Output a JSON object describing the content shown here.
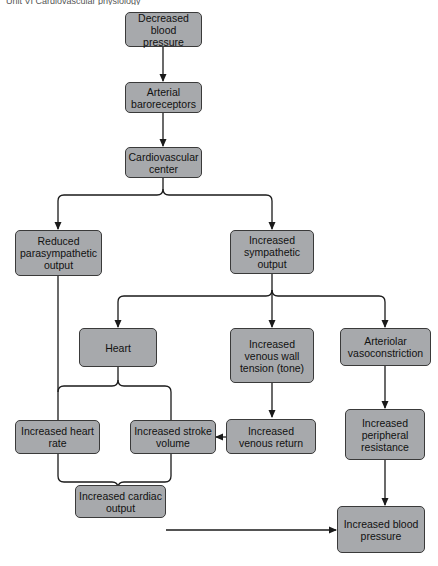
{
  "header": {
    "text": "Unit VI  Cardiovascular physiology"
  },
  "footer": {
    "text": "Figure: baroreceptor reflex response to decreased blood pressure"
  },
  "colors": {
    "node_fill": "#a7a9ac",
    "node_border": "#3a3a3a",
    "arrow": "#1a1a1a"
  },
  "nodes": {
    "decreased_bp": "Decreased blood pressure",
    "baroreceptors": "Arterial baroreceptors",
    "cv_center": "Cardiovascular center",
    "parasympathetic": "Reduced parasympathetic output",
    "sympathetic": "Increased sympathetic output",
    "heart": "Heart",
    "venous_tension": "Increased venous wall tension (tone)",
    "vasoconstriction": "Arteriolar vasoconstriction",
    "heart_rate": "Increased heart rate",
    "stroke_volume": "Increased stroke volume",
    "venous_return": "Increased venous return",
    "peripheral_resistance": "Increased peripheral resistance",
    "cardiac_output": "Increased cardiac output",
    "increased_bp": "Increased blood pressure"
  },
  "edges": [
    [
      "decreased_bp",
      "baroreceptors"
    ],
    [
      "baroreceptors",
      "cv_center"
    ],
    [
      "cv_center",
      "parasympathetic"
    ],
    [
      "cv_center",
      "sympathetic"
    ],
    [
      "sympathetic",
      "heart"
    ],
    [
      "sympathetic",
      "venous_tension"
    ],
    [
      "sympathetic",
      "vasoconstriction"
    ],
    [
      "parasympathetic",
      "heart_rate"
    ],
    [
      "heart",
      "heart_rate"
    ],
    [
      "heart",
      "stroke_volume"
    ],
    [
      "venous_tension",
      "venous_return"
    ],
    [
      "venous_return",
      "stroke_volume"
    ],
    [
      "vasoconstriction",
      "peripheral_resistance"
    ],
    [
      "heart_rate",
      "cardiac_output"
    ],
    [
      "stroke_volume",
      "cardiac_output"
    ],
    [
      "cardiac_output",
      "increased_bp"
    ],
    [
      "peripheral_resistance",
      "increased_bp"
    ]
  ]
}
